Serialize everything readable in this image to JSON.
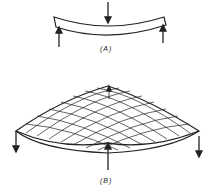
{
  "figure": {
    "panel_a": {
      "label": "(A)",
      "description": "Beam bending: downward load at center, upward reactions at both ends"
    },
    "panel_b": {
      "label": "(B)",
      "description": "Plate (saddle) bending: grid surface, downward loads at corners, upward load at center front, upward at back"
    },
    "colors": {
      "stroke": "#222222",
      "background": "#ffffff"
    }
  }
}
